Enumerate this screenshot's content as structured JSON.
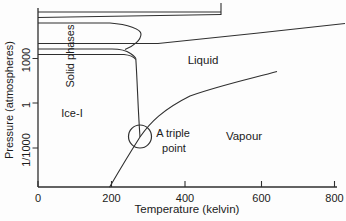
{
  "figure": {
    "background": "#fdfdfd",
    "line_color": "#2f2f2f",
    "text_color": "#1b1b1b"
  },
  "axes": {
    "x": {
      "title": "Temperature (kelvin)",
      "axis_y": 187,
      "start": 38,
      "end": 337,
      "tick_len": 6,
      "label_y": 197.5,
      "ticks": [
        {
          "label": "0",
          "px": 38
        },
        {
          "label": "200",
          "px": 111.5
        },
        {
          "label": "400",
          "px": 185
        },
        {
          "label": "600",
          "px": 261.5
        },
        {
          "label": "800",
          "px": 334.5
        }
      ]
    },
    "y": {
      "title": "Pressure (atmospheres)",
      "axis_x": 38,
      "start": 8,
      "end": 187,
      "tick_len": 5.5,
      "label_x": 26,
      "ticks": [
        {
          "label": "1000",
          "py": 58.5
        },
        {
          "label": "1",
          "py": 103
        },
        {
          "label": "1/1000",
          "py": 148
        }
      ]
    }
  },
  "labels": [
    {
      "name": "y-axis-title",
      "text": "Pressure (atmospheres)",
      "x": 9,
      "y": 100,
      "rotate": -90,
      "size": 11
    },
    {
      "name": "x-axis-title",
      "text": "Temperature (kelvin)",
      "x": 187,
      "y": 210,
      "rotate": 0,
      "size": 11.5
    },
    {
      "name": "region-label-solid-phases",
      "text": "Solid phases",
      "x": 70,
      "y": 56,
      "rotate": -90,
      "size": 11
    },
    {
      "name": "region-label-ice-i",
      "text": "Ice-I",
      "x": 72,
      "y": 113,
      "rotate": 0,
      "size": 11
    },
    {
      "name": "region-label-liquid",
      "text": "Liquid",
      "x": 203,
      "y": 61,
      "rotate": 0,
      "size": 11.5
    },
    {
      "name": "region-label-vapour",
      "text": "Vapour",
      "x": 244,
      "y": 137,
      "rotate": 0,
      "size": 11.5
    },
    {
      "name": "triple-point-label-line1",
      "text": "A triple",
      "x": 173,
      "y": 133,
      "rotate": 0,
      "size": 11
    },
    {
      "name": "triple-point-label-line2",
      "text": "point",
      "x": 174,
      "y": 148,
      "rotate": 0,
      "size": 11
    }
  ],
  "boundaries": [
    {
      "name": "boundary-top-upper-line",
      "d": "M38,12 H221"
    },
    {
      "name": "boundary-top-lower-line",
      "d": "M38,17.5 L221,14.5"
    },
    {
      "name": "boundary-top-vertical-bracket",
      "d": "M221,3 L221,15"
    },
    {
      "name": "boundary-solid-lobe",
      "d": "M38,23 H110 C128,24.5 141,29 141,34 C141,40 134,46 125,49.5"
    },
    {
      "name": "boundary-high-pressure-melting",
      "d": "M38,43.5 H158 C210,38.5 290,29.5 345,23.5"
    },
    {
      "name": "boundary-solid-line-mid",
      "d": "M38,49 H112 C120,49 127,51 130.5,53.5 C133.5,55.5 135.2,56.8 135.8,58.5"
    },
    {
      "name": "boundary-solid-line-low",
      "d": "M38,54.5 H124 C129,55 133.5,56.5 135.8,59.5"
    },
    {
      "name": "boundary-ice-i-melting-vertical",
      "d": "M135.8,58.5 C137.5,85 138,110 140,137"
    },
    {
      "name": "boundary-sublimation-vaporization",
      "d": "M109.5,187.3 Q126,159 140,137 C150,122.5 163,109.5 190,96 C223,84.5 256,77.5 277,71.5"
    }
  ],
  "annotation_circle": {
    "cx": 140,
    "cy": 136.5,
    "r": 11.5
  },
  "chart_data": {
    "type": "line",
    "subtype": "phase-diagram-of-water",
    "title": "",
    "xlabel": "Temperature (kelvin)",
    "ylabel": "Pressure (atmospheres)",
    "x_scale": "linear",
    "y_scale": "log",
    "xlim": [
      0,
      806
    ],
    "ylim_atm": [
      2e-06,
      2500000.0
    ],
    "x_tick_values": [
      0,
      200,
      400,
      600,
      800
    ],
    "y_tick_labels": [
      "1/1000",
      "1",
      "1000"
    ],
    "grid": false,
    "legend": "none",
    "regions": [
      "Solid phases",
      "Ice-I",
      "Liquid",
      "Vapour"
    ],
    "annotations": [
      {
        "text": "A triple point",
        "T_K": 273,
        "P_atm": 0.006,
        "marker": "circle-outline"
      }
    ],
    "series": [
      {
        "name": "sublimation line (Ice-I / Vapour)",
        "T_K": [
          193,
          240,
          275
        ],
        "P_atm": [
          2e-06,
          0.0002,
          0.005
        ]
      },
      {
        "name": "vaporization line (Liquid / Vapour)",
        "T_K": [
          275,
          337,
          410,
          517,
          644
        ],
        "P_atm": [
          0.005,
          1,
          3,
          21,
          130
        ]
      },
      {
        "name": "Ice-I melting line (nearly vertical)",
        "T_K": [
          274,
          264
        ],
        "P_atm": [
          0.005,
          1000
        ]
      },
      {
        "name": "high-pressure melting line",
        "T_K": [
          323,
          571,
          827
        ],
        "P_atm": [
          10000.0,
          44000.0,
          230000.0
        ]
      },
      {
        "name": "solid-solid boundary (≈10000 atm)",
        "T_K": [
          0,
          323
        ],
        "P_atm": [
          10000.0,
          10000.0
        ]
      },
      {
        "name": "solid-solid boundary (≈4400 atm)",
        "T_K": [
          0,
          237
        ],
        "P_atm": [
          4400.0,
          4400.0
        ]
      },
      {
        "name": "solid-solid boundary (≈1900 atm)",
        "T_K": [
          0,
          264
        ],
        "P_atm": [
          1900.0,
          1900.0
        ]
      },
      {
        "name": "solid lobe boundary",
        "T_K": [
          0,
          230,
          277,
          235
        ],
        "P_atm": [
          260000.0,
          220000.0,
          30000.0,
          4500.0
        ]
      },
      {
        "name": "upper solid boundary A",
        "T_K": [
          0,
          493
        ],
        "P_atm": [
          1400000.0,
          1400000.0
        ]
      },
      {
        "name": "upper solid boundary B",
        "T_K": [
          0,
          493
        ],
        "P_atm": [
          590000.0,
          700000.0
        ]
      },
      {
        "name": "vertical bracket boundary",
        "T_K": [
          493,
          493
        ],
        "P_atm": [
          600000.0,
          5000000.0
        ]
      }
    ]
  }
}
